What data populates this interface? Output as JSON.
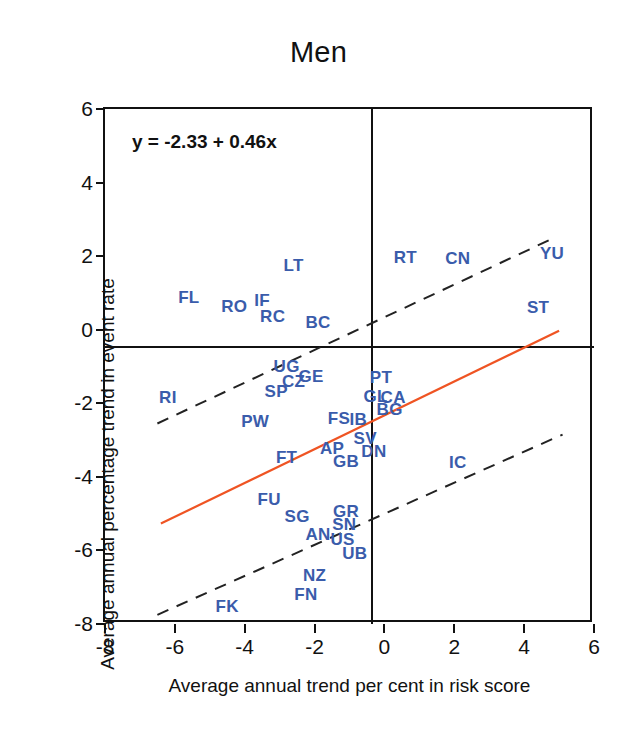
{
  "chart_data": {
    "type": "scatter",
    "title": "Men",
    "xlabel": "Average annual trend per cent in risk score",
    "ylabel": "Average annual percentage trend in event rate",
    "xlim": [
      -8,
      6
    ],
    "ylim": [
      -8,
      6
    ],
    "xticks": [
      -8,
      -6,
      -4,
      -2,
      0,
      2,
      4,
      6
    ],
    "yticks": [
      -8,
      -6,
      -4,
      -2,
      0,
      2,
      4,
      6
    ],
    "grid": false,
    "legend": null,
    "annotation": "y = -2.33 + 0.46x",
    "regression": {
      "intercept": -2.33,
      "slope": 0.46,
      "color": "#ef5423",
      "x_start": -6.4,
      "x_end": 5.0,
      "y_start": -5.27,
      "y_end": -0.03
    },
    "confidence_bands": {
      "style": "dashed",
      "color": "#222222",
      "upper": {
        "x_start": -6.5,
        "y_start": -2.55,
        "x_end": 4.75,
        "y_end": 2.45
      },
      "lower": {
        "x_start": -6.5,
        "y_start": -7.75,
        "x_end": 5.1,
        "y_end": -2.85
      }
    },
    "label_color": "#3a5cab",
    "points": [
      {
        "label": "FL",
        "x": -5.6,
        "y": 0.85
      },
      {
        "label": "RO",
        "x": -4.3,
        "y": 0.62
      },
      {
        "label": "IF",
        "x": -3.5,
        "y": 0.78
      },
      {
        "label": "RC",
        "x": -3.2,
        "y": 0.35
      },
      {
        "label": "LT",
        "x": -2.6,
        "y": 1.72
      },
      {
        "label": "BC",
        "x": -1.9,
        "y": 0.18
      },
      {
        "label": "RT",
        "x": 0.6,
        "y": 1.95
      },
      {
        "label": "CN",
        "x": 2.1,
        "y": 1.92
      },
      {
        "label": "YU",
        "x": 4.8,
        "y": 2.05
      },
      {
        "label": "ST",
        "x": 4.4,
        "y": 0.58
      },
      {
        "label": "UG",
        "x": -2.8,
        "y": -1.02
      },
      {
        "label": "CZ",
        "x": -2.6,
        "y": -1.42
      },
      {
        "label": "GE",
        "x": -2.1,
        "y": -1.28
      },
      {
        "label": "SP",
        "x": -3.1,
        "y": -1.68
      },
      {
        "label": "RI",
        "x": -6.2,
        "y": -1.85
      },
      {
        "label": "PT",
        "x": -0.1,
        "y": -1.3
      },
      {
        "label": "GL",
        "x": -0.25,
        "y": -1.82
      },
      {
        "label": "CA",
        "x": 0.25,
        "y": -1.86
      },
      {
        "label": "BG",
        "x": 0.15,
        "y": -2.18
      },
      {
        "label": "PW",
        "x": -3.7,
        "y": -2.5
      },
      {
        "label": "FS",
        "x": -1.3,
        "y": -2.42
      },
      {
        "label": "IB",
        "x": -0.75,
        "y": -2.45
      },
      {
        "label": "SV",
        "x": -0.55,
        "y": -2.98
      },
      {
        "label": "AP",
        "x": -1.5,
        "y": -3.25
      },
      {
        "label": "DN",
        "x": -0.3,
        "y": -3.32
      },
      {
        "label": "FT",
        "x": -2.8,
        "y": -3.5
      },
      {
        "label": "GB",
        "x": -1.1,
        "y": -3.6
      },
      {
        "label": "IC",
        "x": 2.1,
        "y": -3.62
      },
      {
        "label": "FU",
        "x": -3.3,
        "y": -4.62
      },
      {
        "label": "SG",
        "x": -2.5,
        "y": -5.1
      },
      {
        "label": "GR",
        "x": -1.1,
        "y": -4.95
      },
      {
        "label": "AN",
        "x": -1.9,
        "y": -5.58
      },
      {
        "label": "SN",
        "x": -1.15,
        "y": -5.3
      },
      {
        "label": "US",
        "x": -1.2,
        "y": -5.72
      },
      {
        "label": "UB",
        "x": -0.85,
        "y": -6.1
      },
      {
        "label": "NZ",
        "x": -2.0,
        "y": -6.7
      },
      {
        "label": "FN",
        "x": -2.25,
        "y": -7.2
      },
      {
        "label": "FK",
        "x": -4.5,
        "y": -7.55
      }
    ]
  }
}
